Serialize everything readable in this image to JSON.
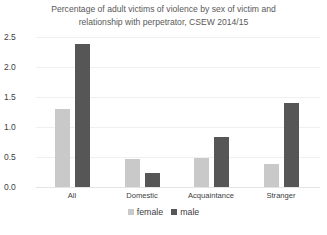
{
  "chart_data": {
    "type": "bar",
    "title": "Percentage of adult victims of violence by sex of victim and relationship with perpetrator, CSEW 2014/15",
    "title_lines": [
      "Percentage of adult victims of violence by sex of victim and",
      "relationship with perpetrator, CSEW 2014/15"
    ],
    "categories": [
      "All",
      "Domestic",
      "Acquaintance",
      "Stranger"
    ],
    "series": [
      {
        "name": "female",
        "color": "#c9c9c9",
        "values": [
          1.3,
          0.47,
          0.48,
          0.39
        ]
      },
      {
        "name": "male",
        "color": "#565656",
        "values": [
          2.38,
          0.23,
          0.83,
          1.4
        ]
      }
    ],
    "xlabel": "",
    "ylabel": "",
    "ylim": [
      0,
      2.5
    ],
    "yticks": [
      "0.0",
      "0.5",
      "1.0",
      "1.5",
      "2.0",
      "2.5"
    ],
    "grid": true,
    "legend_position": "bottom"
  }
}
